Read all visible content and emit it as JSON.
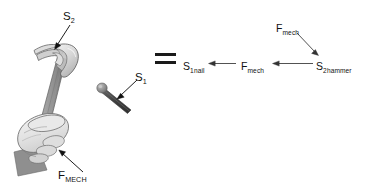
{
  "figure": {
    "background_color": "#ffffff",
    "ink_color": "#111111"
  },
  "left_illustration": {
    "name": "hand holding claw hammer striking nail",
    "hammer": {
      "name": "claw-hammer",
      "head_color": "#d8d8d8",
      "handle_color": "#8f8f8f",
      "outline_color": "#5a5a5a"
    },
    "hand": {
      "name": "hand-gripping-handle",
      "fill_color": "#ececec",
      "outline_color": "#6b6b6b",
      "cuff_color": "#8a8a8a"
    },
    "nail": {
      "name": "nail",
      "head_color": "#9a9a9a",
      "shaft_color": "#4f4f4f"
    }
  },
  "labels": {
    "s2_hammer_pointer": {
      "base": "S",
      "sub": "2"
    },
    "s1_nail_pointer": {
      "base": "S",
      "sub": "1"
    },
    "f_mech_hand": {
      "base": "F",
      "sub": "MECH"
    }
  },
  "equals": {
    "name": "equals-sign",
    "glyph": "="
  },
  "chain_diagram": {
    "nodes": [
      {
        "id": "s1nail",
        "base": "S",
        "sub": "1nail"
      },
      {
        "id": "fmech_mid",
        "base": "F",
        "sub": "mech"
      },
      {
        "id": "s2hammer",
        "base": "S",
        "sub": "2hammer"
      },
      {
        "id": "fmech_top",
        "base": "F",
        "sub": "mech"
      }
    ],
    "arrows": [
      {
        "from": "fmech_mid",
        "to": "s1nail",
        "direction": "left"
      },
      {
        "from": "s2hammer",
        "to": "fmech_mid",
        "direction": "left"
      },
      {
        "from": "fmech_top",
        "to": "s2hammer",
        "direction": "down-right"
      }
    ]
  }
}
